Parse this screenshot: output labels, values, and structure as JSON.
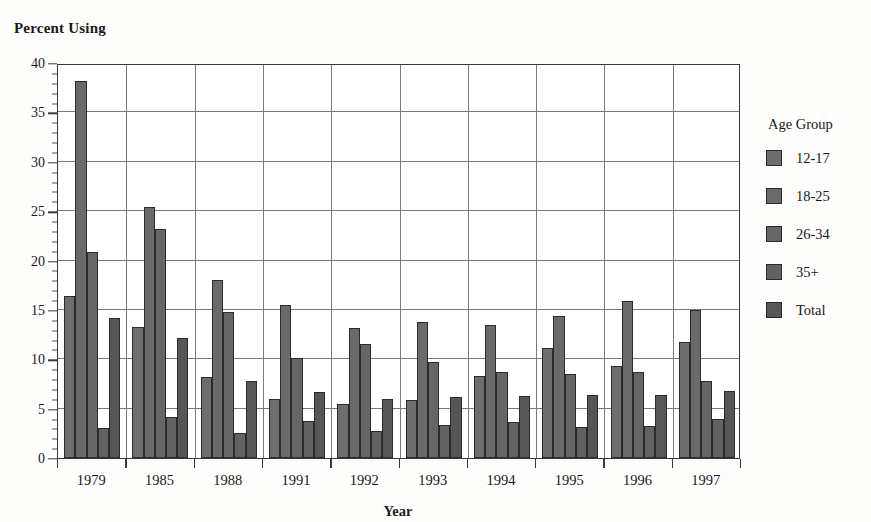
{
  "chart": {
    "title": "Percent Using",
    "xlabel": "Year",
    "legend_title": "Age Group"
  },
  "chart_data": {
    "type": "bar",
    "title": "Percent Using",
    "xlabel": "Year",
    "ylabel": "Percent Using",
    "ylim": [
      0,
      40
    ],
    "ytick_step": 5,
    "yticks": [
      "0",
      "5",
      "10",
      "15",
      "20",
      "25",
      "30",
      "35",
      "40"
    ],
    "grid": true,
    "legend_position": "right",
    "legend_title": "Age Group",
    "categories": [
      "1979",
      "1985",
      "1988",
      "1991",
      "1992",
      "1993",
      "1994",
      "1995",
      "1996",
      "1997"
    ],
    "series": [
      {
        "name": "12-17",
        "color": "#6e6e6e",
        "values": [
          16.4,
          13.3,
          8.2,
          6.0,
          5.5,
          5.9,
          8.3,
          11.1,
          9.3,
          11.7
        ]
      },
      {
        "name": "18-25",
        "color": "#6a6a6a",
        "values": [
          38.2,
          25.4,
          18.0,
          15.5,
          13.2,
          13.8,
          13.5,
          14.4,
          15.9,
          15.0
        ]
      },
      {
        "name": "26-34",
        "color": "#666666",
        "values": [
          20.9,
          23.2,
          14.8,
          10.1,
          11.5,
          9.7,
          8.7,
          8.5,
          8.7,
          7.8
        ]
      },
      {
        "name": "35+",
        "color": "#626262",
        "values": [
          3.0,
          4.2,
          2.5,
          3.7,
          2.7,
          3.3,
          3.6,
          3.1,
          3.2,
          4.0
        ]
      },
      {
        "name": "Total",
        "color": "#565656",
        "values": [
          14.2,
          12.2,
          7.8,
          6.7,
          6.0,
          6.2,
          6.3,
          6.4,
          6.4,
          6.8
        ]
      }
    ]
  }
}
